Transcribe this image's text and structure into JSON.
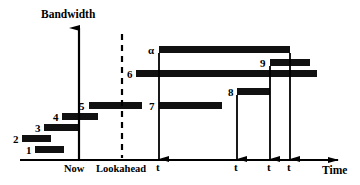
{
  "figure": {
    "type": "timeline-gantt-schedule",
    "y_axis_title": "Bandwidth",
    "x_axis_title": "Time",
    "markers": [
      {
        "name": "now",
        "label": "Now",
        "x": 79
      },
      {
        "name": "lookahead",
        "label": "Lookahead",
        "x": 122
      }
    ],
    "colors": {
      "bar": "#111111",
      "axis": "#000000",
      "background": "#ffffff"
    }
  },
  "chart_data": {
    "type": "bar",
    "title": "",
    "xlabel": "Time",
    "ylabel": "Bandwidth",
    "grid": false,
    "legend": null,
    "annotations": [
      "Now",
      "Lookahead"
    ],
    "categories": [
      "1",
      "2",
      "3",
      "4",
      "5",
      "α",
      "6",
      "7",
      "8",
      "9"
    ],
    "bars": [
      {
        "id": "1",
        "label": "1",
        "x": 35,
        "y": 146,
        "width": 29,
        "height": 7,
        "label_x": 26,
        "label_y": 145
      },
      {
        "id": "2",
        "label": "2",
        "x": 22,
        "y": 135,
        "width": 29,
        "height": 7,
        "label_x": 13,
        "label_y": 134
      },
      {
        "id": "3",
        "label": "3",
        "x": 44,
        "y": 124,
        "width": 35,
        "height": 7,
        "label_x": 35,
        "label_y": 123
      },
      {
        "id": "4",
        "label": "4",
        "x": 62,
        "y": 113,
        "width": 36,
        "height": 7,
        "label_x": 53,
        "label_y": 112
      },
      {
        "id": "5",
        "label": "5",
        "x": 89,
        "y": 102,
        "width": 53,
        "height": 7,
        "label_x": 79,
        "label_y": 101
      },
      {
        "id": "alpha",
        "label": "α",
        "x": 159,
        "y": 46,
        "width": 131,
        "height": 7,
        "label_x": 148,
        "label_y": 45
      },
      {
        "id": "6",
        "label": "6",
        "x": 136,
        "y": 70,
        "width": 181,
        "height": 7,
        "label_x": 127,
        "label_y": 69
      },
      {
        "id": "7",
        "label": "7",
        "x": 159,
        "y": 102,
        "width": 63,
        "height": 7,
        "label_x": 149,
        "label_y": 101
      },
      {
        "id": "8",
        "label": "8",
        "x": 237,
        "y": 88,
        "width": 33,
        "height": 7,
        "label_x": 228,
        "label_y": 87
      },
      {
        "id": "9",
        "label": "9",
        "x": 270,
        "y": 59,
        "width": 40,
        "height": 7,
        "label_x": 260,
        "label_y": 58
      }
    ],
    "deadline_arrows": [
      {
        "for_bar": "alpha",
        "x": 159,
        "y_from": 53,
        "y_to": 159,
        "glyph": "t",
        "glyph_x": 156,
        "glyph_y": 162
      },
      {
        "for_bar": "8",
        "x": 237,
        "y_from": 95,
        "y_to": 159,
        "glyph": "t",
        "glyph_x": 234,
        "glyph_y": 162
      },
      {
        "for_bar": "9",
        "x": 270,
        "y_from": 66,
        "y_to": 159,
        "glyph": "t",
        "glyph_x": 267,
        "glyph_y": 162
      },
      {
        "for_bar": "6",
        "x": 290,
        "y_from": 53,
        "y_to": 159,
        "glyph": "t",
        "glyph_x": 287,
        "glyph_y": 162
      }
    ],
    "axis_ranges": {
      "x_axis_y": 160,
      "x_axis_start": 20,
      "x_axis_end": 348,
      "y_axis_x": 79,
      "y_axis_top": 22,
      "y_axis_bottom": 160
    }
  },
  "labels": {
    "bandwidth": "Bandwidth",
    "time": "Time",
    "now": "Now",
    "lookahead": "Lookahead"
  }
}
